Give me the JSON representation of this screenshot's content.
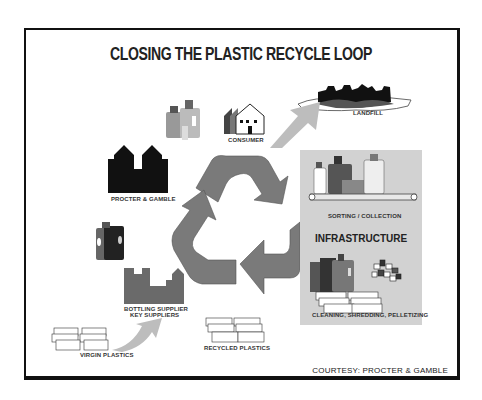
{
  "title": "CLOSING THE PLASTIC RECYCLE LOOP",
  "nodes": {
    "landfill": "LANDFILL",
    "consumer": "CONSUMER",
    "procter_gamble": "PROCTER & GAMBLE",
    "sorting_collection": "SORTING / COLLECTION",
    "infrastructure": "INFRASTRUCTURE",
    "cleaning": "CLEANING, SHREDDING, PELLETIZING",
    "bottling_supplier_line1": "BOTTLING SUPPLIER",
    "bottling_supplier_line2": "KEY SUPPLIERS",
    "virgin_plastics": "VIRGIN PLASTICS",
    "recycled_plastics": "RECYCLED PLASTICS"
  },
  "courtesy": "COURTESY: PROCTER & GAMBLE",
  "colors": {
    "arrow_gray": "#7a7a7a",
    "light_arrow": "#bdbdbd",
    "panel": "#d2d2d2",
    "frame": "#111111"
  }
}
